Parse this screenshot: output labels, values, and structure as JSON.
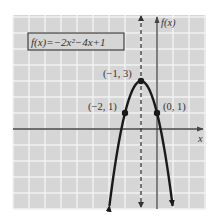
{
  "chart_data": {
    "type": "line",
    "function_label": {
      "prefix": "f(x) = ",
      "text": "f(x)=−2x²−4x+1"
    },
    "xlabel": "x",
    "ylabel": "f(x)",
    "xlim": [
      -9,
      3
    ],
    "ylim": [
      -5,
      7
    ],
    "grid": true,
    "axis_of_symmetry": {
      "x": -1,
      "style": "dashed"
    },
    "series": [
      {
        "name": "f(x) = -2x^2 - 4x + 1",
        "x": [
          -2.975,
          -2.5,
          -2,
          -1.5,
          -1,
          -0.5,
          0,
          0.5,
          0.975
        ],
        "y": [
          -4.8,
          -1.5,
          1,
          2.5,
          3,
          2.5,
          1,
          -1.5,
          -4.8
        ]
      }
    ],
    "points": [
      {
        "x": -1,
        "y": 3,
        "label": "(−1, 3)"
      },
      {
        "x": -2,
        "y": 1,
        "label": "(−2, 1)"
      },
      {
        "x": 0,
        "y": 1,
        "label": "(0, 1)"
      }
    ],
    "colors": {
      "background": "#d6d6d6",
      "grid": "#f2f2f2",
      "curve": "#1a1a1a",
      "axis": "#444444"
    }
  }
}
